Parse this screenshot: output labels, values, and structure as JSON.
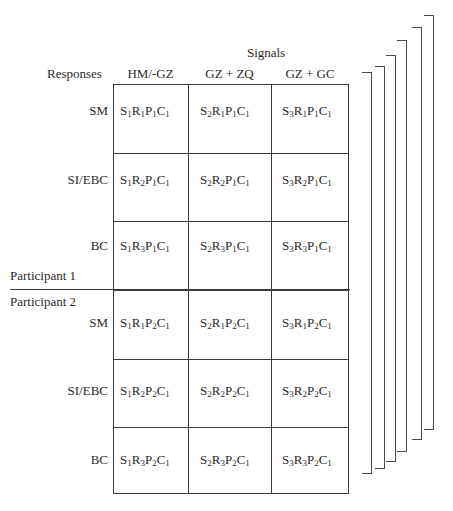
{
  "header": {
    "signals_label": "Signals",
    "responses_label": "Responses",
    "columns": [
      "HM/-GZ",
      "GZ + ZQ",
      "GZ + GC"
    ]
  },
  "participants": [
    {
      "label": "Participant 1",
      "rows": [
        {
          "response": "SM",
          "cells": [
            {
              "S": "1",
              "R": "1",
              "P": "1",
              "C": "1"
            },
            {
              "S": "2",
              "R": "1",
              "P": "1",
              "C": "1"
            },
            {
              "S": "3",
              "R": "1",
              "P": "1",
              "C": "1"
            }
          ]
        },
        {
          "response": "SI/EBC",
          "cells": [
            {
              "S": "1",
              "R": "2",
              "P": "1",
              "C": "1"
            },
            {
              "S": "2",
              "R": "2",
              "P": "1",
              "C": "1"
            },
            {
              "S": "3",
              "R": "2",
              "P": "1",
              "C": "1"
            }
          ]
        },
        {
          "response": "BC",
          "cells": [
            {
              "S": "1",
              "R": "3",
              "P": "1",
              "C": "1"
            },
            {
              "S": "2",
              "R": "3",
              "P": "1",
              "C": "1"
            },
            {
              "S": "3",
              "R": "3",
              "P": "1",
              "C": "1"
            }
          ]
        }
      ]
    },
    {
      "label": "Participant 2",
      "rows": [
        {
          "response": "SM",
          "cells": [
            {
              "S": "1",
              "R": "1",
              "P": "2",
              "C": "1"
            },
            {
              "S": "2",
              "R": "1",
              "P": "2",
              "C": "1"
            },
            {
              "S": "3",
              "R": "1",
              "P": "2",
              "C": "1"
            }
          ]
        },
        {
          "response": "SI/EBC",
          "cells": [
            {
              "S": "1",
              "R": "2",
              "P": "2",
              "C": "1"
            },
            {
              "S": "2",
              "R": "2",
              "P": "2",
              "C": "1"
            },
            {
              "S": "3",
              "R": "2",
              "P": "2",
              "C": "1"
            }
          ]
        },
        {
          "response": "BC",
          "cells": [
            {
              "S": "1",
              "R": "3",
              "P": "2",
              "C": "1"
            },
            {
              "S": "2",
              "R": "3",
              "P": "2",
              "C": "1"
            },
            {
              "S": "3",
              "R": "3",
              "P": "2",
              "C": "1"
            }
          ]
        }
      ]
    }
  ],
  "stacked_layers": {
    "count": 6,
    "brackets": [
      {
        "x": 371,
        "top": 72,
        "bottom": 474
      },
      {
        "x": 384,
        "top": 66,
        "bottom": 469
      },
      {
        "x": 395,
        "top": 55,
        "bottom": 462
      },
      {
        "x": 406,
        "top": 40,
        "bottom": 452
      },
      {
        "x": 421,
        "top": 27,
        "bottom": 440
      },
      {
        "x": 433,
        "top": 15,
        "bottom": 430
      }
    ]
  },
  "colors": {
    "line": "#3a3a3a",
    "text": "#2a2a2a",
    "background": "#ffffff"
  }
}
